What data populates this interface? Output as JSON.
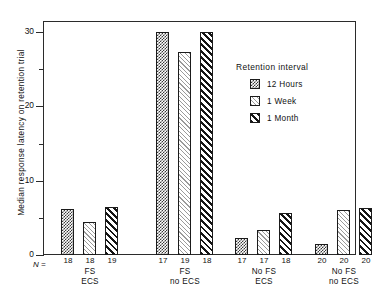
{
  "chart_data": {
    "type": "bar",
    "title": "",
    "xlabel": "",
    "ylabel": "Median response latency on retention trial",
    "ylim": [
      0,
      32
    ],
    "yticks": [
      0,
      10,
      20,
      30
    ],
    "yminorticks": [
      5,
      15,
      25
    ],
    "grid": false,
    "legend_position": "inside-right",
    "legend_title": "Retention interval",
    "categories": [
      "FS ECS",
      "FS no ECS",
      "No FS ECS",
      "No FS no ECS"
    ],
    "group_lines": [
      {
        "line1": "FS",
        "line2": "ECS"
      },
      {
        "line1": "FS",
        "line2": "no ECS"
      },
      {
        "line1": "No FS",
        "line2": "ECS"
      },
      {
        "line1": "No FS",
        "line2": "no ECS"
      }
    ],
    "series": [
      {
        "name": "12 Hours",
        "pattern": "checkerboard",
        "values": [
          6.2,
          30.0,
          2.3,
          1.5
        ],
        "n": [
          18,
          17,
          17,
          20
        ]
      },
      {
        "name": "1 Week",
        "pattern": "light-diagonal",
        "values": [
          4.4,
          27.3,
          3.4,
          6.0
        ],
        "n": [
          18,
          19,
          17,
          20
        ]
      },
      {
        "name": "1 Month",
        "pattern": "bold-diagonal",
        "values": [
          6.4,
          30.0,
          5.7,
          6.3
        ],
        "n": [
          19,
          18,
          18,
          20
        ]
      }
    ],
    "n_prefix": "N ="
  }
}
